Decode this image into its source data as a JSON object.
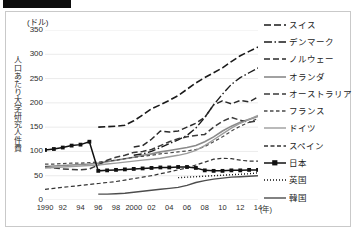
{
  "figure": {
    "redaction_bar": "",
    "unit_label": "(ドル)",
    "y_axis_title": "人口あたり大学研究人件費",
    "x_axis_unit": "(年)"
  },
  "chart_data": {
    "type": "line",
    "title": "",
    "xlabel": "(年)",
    "ylabel": "人口あたり大学研究人件費",
    "yunit": "(ドル)",
    "ylim": [
      0,
      350
    ],
    "yticks": [
      0,
      50,
      100,
      150,
      200,
      250,
      300,
      350
    ],
    "xlim": [
      1990,
      2014
    ],
    "x": [
      1990,
      1991,
      1992,
      1993,
      1994,
      1995,
      1996,
      1997,
      1998,
      1999,
      2000,
      2001,
      2002,
      2003,
      2004,
      2005,
      2006,
      2007,
      2008,
      2009,
      2010,
      2011,
      2012,
      2013,
      2014
    ],
    "xtick_labels": [
      "1990",
      "92",
      "94",
      "96",
      "98",
      "2000",
      "02",
      "04",
      "06",
      "08",
      "10",
      "12",
      "14"
    ],
    "xtick_values": [
      1990,
      1992,
      1994,
      1996,
      1998,
      2000,
      2002,
      2004,
      2006,
      2008,
      2010,
      2012,
      2014
    ],
    "grid": "horizontal",
    "legend_position": "right",
    "series": [
      {
        "name": "スイス",
        "style": "dashed-long",
        "color": "#1a1a1a",
        "width": 1.6,
        "dash": "7,3",
        "marker": "none",
        "values": [
          null,
          null,
          null,
          null,
          null,
          null,
          150,
          151,
          152,
          154,
          163,
          175,
          188,
          196,
          205,
          215,
          228,
          241,
          252,
          262,
          272,
          285,
          297,
          306,
          315
        ]
      },
      {
        "name": "デンマーク",
        "style": "dash-dot",
        "color": "#1a1a1a",
        "width": 1.4,
        "dash": "8,2.5,1.5,2.5",
        "marker": "none",
        "values": [
          null,
          null,
          null,
          null,
          null,
          null,
          null,
          null,
          null,
          null,
          92,
          95,
          100,
          108,
          116,
          124,
          133,
          148,
          170,
          196,
          218,
          238,
          252,
          262,
          272
        ]
      },
      {
        "name": "ノルウェー",
        "style": "dashed-medium",
        "color": "#2a2a2a",
        "width": 1.5,
        "dash": "6,3",
        "marker": "none",
        "values": [
          null,
          null,
          null,
          null,
          null,
          null,
          null,
          null,
          null,
          null,
          109,
          112,
          125,
          142,
          140,
          142,
          150,
          158,
          170,
          196,
          204,
          198,
          205,
          202,
          212
        ]
      },
      {
        "name": "オランダ",
        "style": "solid-gray",
        "color": "#8a8a8a",
        "width": 1.6,
        "dash": "none",
        "marker": "none",
        "values": [
          69,
          70,
          71,
          72,
          73,
          74,
          76,
          79,
          82,
          85,
          88,
          92,
          95,
          99,
          102,
          105,
          108,
          112,
          120,
          130,
          142,
          152,
          160,
          166,
          172
        ]
      },
      {
        "name": "オーストラリア",
        "style": "dashed-medium",
        "color": "#3a3a3a",
        "width": 1.5,
        "dash": "6,3",
        "marker": "none",
        "values": [
          68,
          66,
          64,
          63,
          62,
          64,
          72,
          82,
          88,
          92,
          98,
          100,
          104,
          112,
          120,
          126,
          130,
          133,
          135,
          150,
          162,
          170,
          164,
          160,
          163
        ]
      },
      {
        "name": "フランス",
        "style": "dashed-short",
        "color": "#4a4a4a",
        "width": 1.2,
        "dash": "3.5,2.5",
        "marker": "none",
        "values": [
          74,
          74,
          75,
          76,
          76,
          77,
          78,
          80,
          82,
          85,
          88,
          90,
          92,
          95,
          97,
          99,
          101,
          104,
          110,
          120,
          130,
          142,
          152,
          160,
          168
        ]
      },
      {
        "name": "ドイツ",
        "style": "solid-gray-light",
        "color": "#9c9c9c",
        "width": 1.4,
        "dash": "none",
        "marker": "none",
        "values": [
          66,
          67,
          68,
          69,
          70,
          71,
          72,
          74,
          76,
          78,
          80,
          82,
          84,
          86,
          89,
          92,
          96,
          102,
          112,
          124,
          136,
          148,
          158,
          166,
          174
        ]
      },
      {
        "name": "スペイン",
        "style": "dashed-short",
        "color": "#333333",
        "width": 1.2,
        "dash": "4,2.5",
        "marker": "none",
        "values": [
          22,
          24,
          26,
          28,
          30,
          32,
          34,
          36,
          38,
          41,
          44,
          47,
          50,
          54,
          58,
          62,
          66,
          72,
          78,
          84,
          86,
          85,
          82,
          80,
          80
        ]
      },
      {
        "name": "日本",
        "style": "solid-marker",
        "color": "#111111",
        "width": 1.5,
        "dash": "none",
        "marker": "square",
        "values": [
          103,
          105,
          108,
          112,
          114,
          120,
          60,
          61,
          62,
          63,
          64,
          65,
          66,
          67,
          67,
          68,
          68,
          66,
          61,
          60,
          60,
          61,
          61,
          62,
          62
        ]
      },
      {
        "name": "英国",
        "style": "dotted",
        "color": "#111111",
        "width": 1.4,
        "dash": "1,2",
        "marker": "none",
        "values": [
          null,
          null,
          null,
          null,
          null,
          null,
          null,
          null,
          null,
          null,
          null,
          null,
          null,
          null,
          null,
          46,
          47,
          48,
          49,
          50,
          51,
          52,
          53,
          54,
          56
        ]
      },
      {
        "name": "韓国",
        "style": "solid-dark",
        "color": "#4d4d4d",
        "width": 1.4,
        "dash": "none",
        "marker": "none",
        "values": [
          null,
          null,
          null,
          null,
          null,
          null,
          12,
          12,
          13,
          14,
          16,
          18,
          20,
          22,
          24,
          26,
          30,
          36,
          40,
          43,
          45,
          47,
          48,
          49,
          50
        ]
      }
    ]
  },
  "legend": {
    "items": [
      {
        "label": "スイス",
        "series": 0
      },
      {
        "label": "デンマーク",
        "series": 1
      },
      {
        "label": "ノルウェー",
        "series": 2
      },
      {
        "label": "オランダ",
        "series": 3
      },
      {
        "label": "オーストラリア",
        "series": 4
      },
      {
        "label": "フランス",
        "series": 5
      },
      {
        "label": "ドイツ",
        "series": 6
      },
      {
        "label": "スペイン",
        "series": 7
      },
      {
        "label": "日本",
        "series": 8
      },
      {
        "label": "英国",
        "series": 9
      },
      {
        "label": "韓国",
        "series": 10
      }
    ]
  }
}
